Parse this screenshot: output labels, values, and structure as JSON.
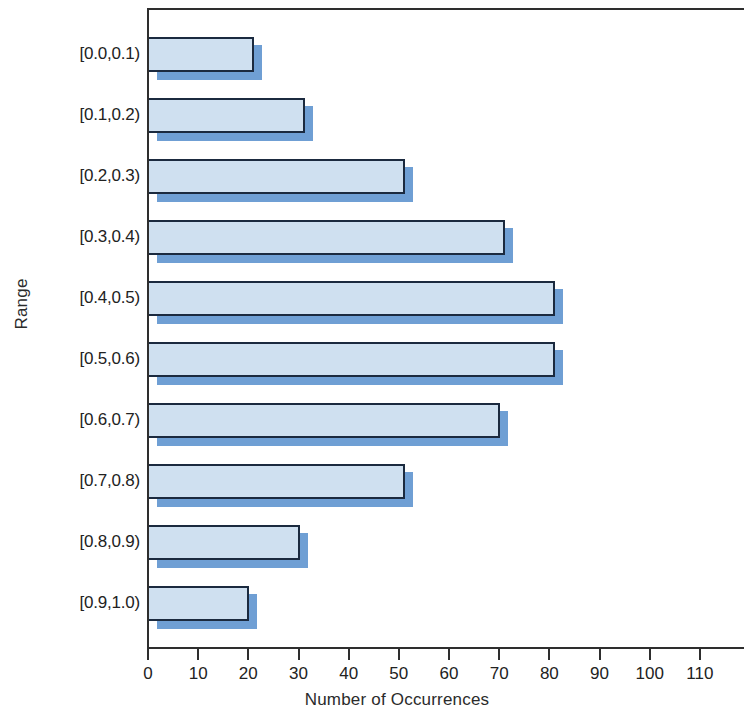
{
  "chart_data": {
    "type": "bar",
    "orientation": "horizontal",
    "title": "",
    "xlabel": "Number of Occurrences",
    "ylabel": "Range",
    "categories": [
      "[0.0,0.1)",
      "[0.1,0.2)",
      "[0.2,0.3)",
      "[0.3,0.4)",
      "[0.4,0.5)",
      "[0.5,0.6)",
      "[0.6,0.7)",
      "[0.7,0.8)",
      "[0.8,0.9)",
      "[0.9,1.0)"
    ],
    "values": [
      21,
      31,
      51,
      71,
      81,
      81,
      70,
      51,
      30,
      20
    ],
    "xlim": [
      0,
      119
    ],
    "xticks": [
      0,
      10,
      20,
      30,
      40,
      50,
      60,
      70,
      80,
      90,
      100,
      110
    ],
    "xtick_labels": [
      "0",
      "10",
      "20",
      "30",
      "40",
      "50",
      "60",
      "70",
      "80",
      "90",
      "100",
      "110"
    ],
    "grid": false,
    "legend": null,
    "bar_fill_color": "#cfe0f0",
    "bar_shadow_color": "#6f9fd4",
    "bar_outline_color": "#1b2a3f",
    "axis_color": "#2e2e2e",
    "background_color": "#ffffff"
  }
}
